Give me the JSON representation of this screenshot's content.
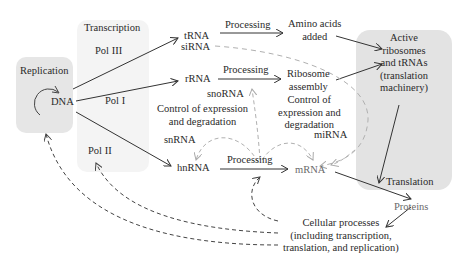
{
  "colors": {
    "panel_replication": "#e6e6e6",
    "panel_transcription": "#f3f3f3",
    "panel_translation": "#e3e3e3",
    "solid_arrow": "#333333",
    "dashed_arrow_dark": "#444444",
    "dashed_arrow_light": "#b0b0b0",
    "text": "#2a2a2a",
    "text_grey": "#6a6a6a"
  },
  "panels": {
    "replication": {
      "title": "Replication",
      "center_label": "DNA"
    },
    "transcription": {
      "title": "Transcription",
      "polymerases": [
        "Pol III",
        "Pol I",
        "Pol II"
      ]
    },
    "translation": {
      "title": "Active\nribosomes\nand tRNAs\n(translation\nmachinery)",
      "bottom_label": "Translation"
    }
  },
  "nodes": {
    "trna": "tRNA",
    "sirna": "siRNA",
    "rrna": "rRNA",
    "snorna": "snoRNA",
    "snrna": "snRNA",
    "hnrna": "hnRNA",
    "mrna": "mRNA",
    "mirna": "miRNA",
    "amino_acids": "Amino acids\nadded",
    "ribosome_assembly": "Ribosome\nassembly",
    "proteins": "Proteins",
    "cellular_processes": "Cellular processes\n(including transcription,\ntranslation, and replication)"
  },
  "edge_labels": {
    "processing_trna": "Processing",
    "processing_rrna": "Processing",
    "processing_hnrna": "Processing",
    "control_left": "Control of expression\nand degradation",
    "control_right": "Control of\nexpression and\ndegradation"
  }
}
